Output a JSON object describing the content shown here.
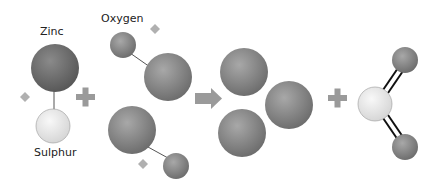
{
  "diagram": {
    "labels": {
      "zinc": "Zinc",
      "sulphur": "Sulphur",
      "oxygen": "Oxygen"
    },
    "operators": [
      "+",
      "→",
      "+"
    ],
    "reactants": [
      {
        "name": "zinc-sulphide",
        "atoms": [
          "Zinc",
          "Sulphur"
        ]
      },
      {
        "name": "oxygen",
        "atoms": [
          "Oxygen",
          "Oxygen",
          "Oxygen",
          "Oxygen"
        ]
      }
    ],
    "products": [
      {
        "name": "zinc-oxide",
        "atoms": 3
      },
      {
        "name": "sulphur-dioxide",
        "atoms": [
          "Sulphur",
          "Oxygen",
          "Oxygen"
        ]
      }
    ],
    "colors": {
      "dark_atom": "#7d7d7d",
      "light_atom": "#e4e4e4",
      "operator": "#9a9a9a",
      "diamond": "#b0b0b0"
    }
  }
}
